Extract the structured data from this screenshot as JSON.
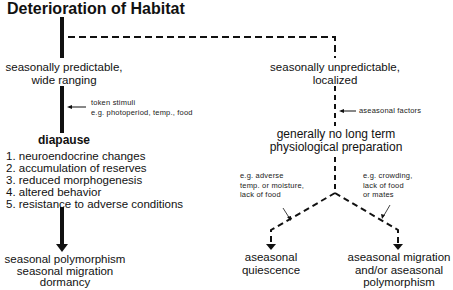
{
  "title": "Deterioration of Habitat",
  "left_branch": {
    "habitat": [
      "seasonally predictable,",
      "wide ranging"
    ],
    "cue_annotation": [
      "token stimuli",
      "e.g. photoperiod, temp., food"
    ],
    "response": "diapause",
    "features": [
      "1. neuroendocrine changes",
      "2. accumulation of reserves",
      "3. reduced morphogenesis",
      "4. altered behavior",
      "5. resistance to adverse conditions"
    ],
    "outcomes": [
      "seasonal polymorphism",
      "seasonal migration",
      "dormancy"
    ]
  },
  "right_branch": {
    "habitat": [
      "seasonally unpredictable,",
      "localized"
    ],
    "cue_annotation": "aseasonal factors",
    "response": [
      "generally no long term",
      "physiological preparation"
    ],
    "sub_left": {
      "annotation": [
        "e.g. adverse",
        "temp. or moisture,",
        "lack of food"
      ],
      "outcome": [
        "aseasonal",
        "quiescence"
      ]
    },
    "sub_right": {
      "annotation": [
        "e.g. crowding,",
        "lack of food",
        "or mates"
      ],
      "outcome": [
        "aseasonal migration",
        "and/or aseasonal",
        "polymorphism"
      ]
    }
  },
  "colors": {
    "ink": "#111111",
    "background": "#ffffff"
  }
}
